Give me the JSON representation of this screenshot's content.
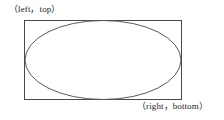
{
  "figure": {
    "name": "ellipse-bounding-box-diagram",
    "background_color": "#ffffff",
    "stroke_color": "#4a4a4a",
    "text_color": "#1d1d1d",
    "labels": {
      "top_left": "（left，top）",
      "bottom_right": "（right，bottom）"
    },
    "shapes": {
      "rectangle": {
        "name": "bounding-rectangle",
        "x": 24,
        "y": 20,
        "width": 158,
        "height": 80,
        "stroke": "#4a4a4a",
        "stroke_width": 1,
        "fill": "none"
      },
      "ellipse": {
        "name": "inscribed-ellipse",
        "cx": 103,
        "cy": 60,
        "rx": 78,
        "ry": 40,
        "stroke": "#5a5a5a",
        "stroke_width": 1,
        "fill": "none"
      }
    }
  }
}
